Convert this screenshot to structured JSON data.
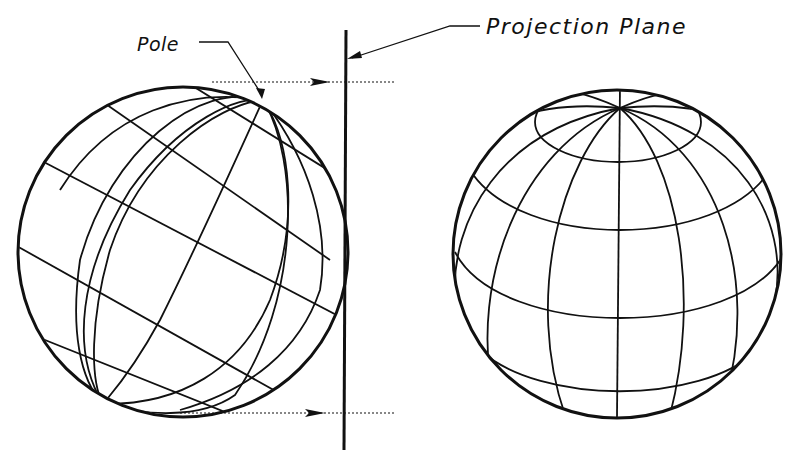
{
  "figure": {
    "labels": {
      "pole": "Pole",
      "projection_plane": "Projection Plane"
    },
    "elements": {
      "left_globe": "tilted globe with pole touching projection plane",
      "projection_plane": "vertical line",
      "right_globe": "globe viewed with pole at top"
    },
    "colors": {
      "ink": "#111111",
      "background": "#ffffff"
    }
  }
}
